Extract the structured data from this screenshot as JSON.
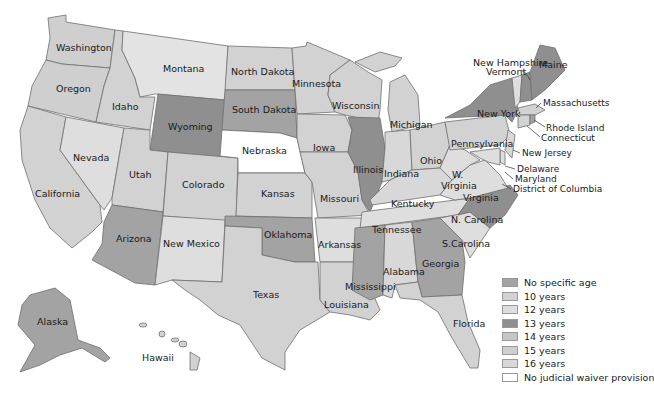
{
  "map": {
    "title": "",
    "categories": {
      "none": {
        "label": "No specific age",
        "color": "#a3a3a3"
      },
      "y10": {
        "label": "10 years",
        "color": "#d2d2d2"
      },
      "y12": {
        "label": "12 years",
        "color": "#dedede"
      },
      "y13": {
        "label": "13 years",
        "color": "#8f8f8f"
      },
      "y14": {
        "label": "14 years",
        "color": "#c6c6c6"
      },
      "y15": {
        "label": "15 years",
        "color": "#cfcfcf"
      },
      "y16": {
        "label": "16 years",
        "color": "#d8d8d8"
      },
      "nojw": {
        "label": "No judicial waiver provision",
        "color": "#ffffff"
      }
    },
    "states": {
      "washington": "Washington",
      "oregon": "Oregon",
      "california": "California",
      "idaho": "Idaho",
      "nevada": "Nevada",
      "montana": "Montana",
      "wyoming": "Wyoming",
      "utah": "Utah",
      "arizona": "Arizona",
      "colorado": "Colorado",
      "new_mexico": "New Mexico",
      "north_dakota": "North Dakota",
      "south_dakota": "South Dakota",
      "nebraska": "Nebraska",
      "kansas": "Kansas",
      "oklahoma": "Oklahoma",
      "texas": "Texas",
      "minnesota": "Minnesota",
      "iowa": "Iowa",
      "missouri": "Missouri",
      "arkansas": "Arkansas",
      "louisiana": "Louisiana",
      "wisconsin": "Wisconsin",
      "illinois": "Illinois",
      "michigan": "Michigan",
      "indiana": "Indiana",
      "ohio": "Ohio",
      "kentucky": "Kentucky",
      "tennessee": "Tennessee",
      "mississippi": "Mississippi",
      "alabama": "Alabama",
      "georgia": "Georgia",
      "florida": "Florida",
      "s_carolina": "S.Carolina",
      "n_carolina": "N. Carolina",
      "virginia": "Virginia",
      "w_virginia_1": "W.",
      "w_virginia_2": "Virginia",
      "pennsylvania": "Pennsylvania",
      "new_york": "New York",
      "maine": "Maine",
      "new_hampshire": "New Hampshire",
      "vermont": "Vermont",
      "massachusetts": "Massachusetts",
      "rhode_island": "Rhode Island",
      "connecticut": "Connecticut",
      "new_jersey": "New Jersey",
      "delaware": "Delaware",
      "maryland": "Maryland",
      "dc": "District of Columbia",
      "alaska": "Alaska",
      "hawaii": "Hawaii"
    }
  },
  "legend": [
    {
      "label": "No specific age",
      "color": "#a3a3a3"
    },
    {
      "label": "10 years",
      "color": "#d2d2d2"
    },
    {
      "label": "12 years",
      "color": "#dedede"
    },
    {
      "label": "13 years",
      "color": "#8f8f8f"
    },
    {
      "label": "14 years",
      "color": "#c6c6c6"
    },
    {
      "label": "15 years",
      "color": "#cfcfcf"
    },
    {
      "label": "16 years",
      "color": "#d8d8d8"
    },
    {
      "label": "No judicial waiver provision",
      "color": "#ffffff"
    }
  ]
}
